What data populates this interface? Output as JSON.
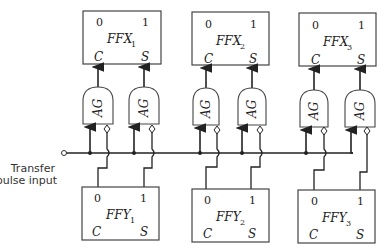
{
  "input": {
    "line1": "Transfer",
    "line2": "pulse input"
  },
  "gate_label": "AG",
  "ffx": [
    {
      "name": "FFX",
      "sub": "1",
      "out0": "0",
      "out1": "1",
      "inC": "C",
      "inS": "S"
    },
    {
      "name": "FFX",
      "sub": "2",
      "out0": "0",
      "out1": "1",
      "inC": "C",
      "inS": "S"
    },
    {
      "name": "FFX",
      "sub": "3",
      "out0": "0",
      "out1": "1",
      "inC": "C",
      "inS": "S"
    }
  ],
  "ffy": [
    {
      "name": "FFY",
      "sub": "1",
      "out0": "0",
      "out1": "1",
      "inC": "C",
      "inS": "S"
    },
    {
      "name": "FFY",
      "sub": "2",
      "out0": "0",
      "out1": "1",
      "inC": "C",
      "inS": "S"
    },
    {
      "name": "FFY",
      "sub": "3",
      "out0": "0",
      "out1": "1",
      "inC": "C",
      "inS": "S"
    }
  ]
}
